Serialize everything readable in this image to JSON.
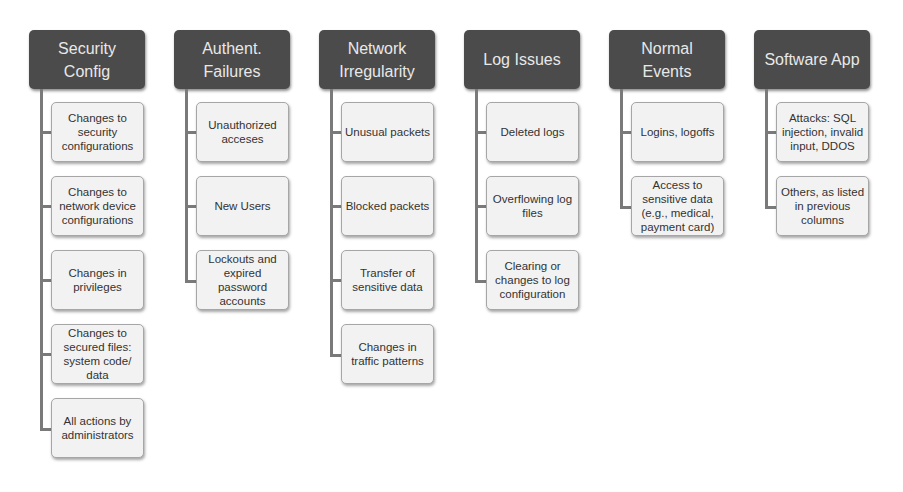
{
  "diagram": {
    "colors": {
      "header_bg": "#4b4b4b",
      "header_text": "#e8e8e8",
      "child_bg": "#f2f2f2",
      "child_border": "#a6a6a6",
      "connector": "#7a7a7a"
    },
    "columns": [
      {
        "title": "Security\nConfig",
        "items": [
          "Changes to\nsecurity\nconfigurations",
          "Changes to\nnetwork device\nconfigurations",
          "Changes in\nprivileges",
          "Changes to\nsecured files:\nsystem code/\ndata",
          "All actions by\nadministrators"
        ]
      },
      {
        "title": "Authent.\nFailures",
        "items": [
          "Unauthorized\nacceses",
          "New Users",
          "Lockouts and\nexpired\npassword\naccounts"
        ]
      },
      {
        "title": "Network\nIrregularity",
        "items": [
          "Unusual packets",
          "Blocked packets",
          "Transfer of\nsensitive data",
          "Changes in\ntraffic patterns"
        ]
      },
      {
        "title": "Log Issues",
        "items": [
          "Deleted logs",
          "Overflowing log\nfiles",
          "Clearing or\nchanges to log\nconfiguration"
        ]
      },
      {
        "title": "Normal\nEvents",
        "items": [
          "Logins, logoffs",
          "Access to\nsensitive data\n(e.g., medical,\npayment card)"
        ]
      },
      {
        "title": "Software App",
        "items": [
          "Attacks: SQL\ninjection, invalid\ninput, DDOS",
          "Others, as listed\nin previous\ncolumns"
        ]
      }
    ]
  }
}
